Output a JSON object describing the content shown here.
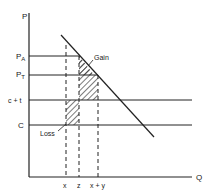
{
  "diagram": {
    "axes": {
      "y_label": "P",
      "x_label": "Q"
    },
    "price_levels": [
      {
        "id": "pa",
        "label_main": "P",
        "label_sub": "A",
        "y": 56
      },
      {
        "id": "pt",
        "label_main": "P",
        "label_sub": "T",
        "y": 75
      },
      {
        "id": "ct",
        "label_main": "c + t",
        "label_sub": "",
        "y": 100
      },
      {
        "id": "c",
        "label_main": "C",
        "label_sub": "",
        "y": 125
      }
    ],
    "quantity_marks": [
      {
        "id": "x",
        "label": "x",
        "x": 66
      },
      {
        "id": "z",
        "label": "z",
        "x": 79
      },
      {
        "id": "xy",
        "label": "x + y",
        "x": 98
      }
    ],
    "annotations": {
      "gain": "Gain",
      "loss": "Loss"
    },
    "colors": {
      "line": "#222222",
      "hatch": "#222222",
      "background": "#ffffff"
    }
  }
}
